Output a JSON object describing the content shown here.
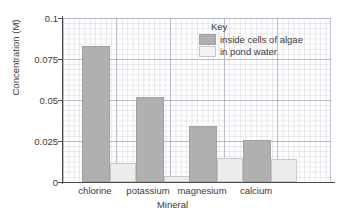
{
  "chart_data": {
    "type": "bar",
    "title": "",
    "xlabel": "Mineral",
    "ylabel": "Concentration (M)",
    "categories": [
      "chlorine",
      "potassium",
      "magnesium",
      "calcium"
    ],
    "series": [
      {
        "name": "inside cells of algae",
        "color": "#b0b0b0",
        "values": [
          0.083,
          0.052,
          0.034,
          0.0255
        ]
      },
      {
        "name": "in pond water",
        "color": "#ececec",
        "values": [
          0.0115,
          0.0035,
          0.0145,
          0.0138
        ]
      }
    ],
    "ylim": [
      0,
      0.1
    ],
    "yticks": [
      0,
      0.025,
      0.05,
      0.075,
      0.1
    ],
    "ytick_labels": [
      "0",
      "0.025",
      "0.05",
      "0.075",
      "0.1"
    ],
    "grid": true,
    "legend": {
      "title": "Key",
      "position": "top-right"
    }
  },
  "legend": {
    "title": "Key",
    "entries": [
      {
        "label": "inside cells of algae"
      },
      {
        "label": "in pond water"
      }
    ]
  },
  "axes": {
    "y_title": "Concentration (M)",
    "x_title": "Mineral",
    "y_labels": [
      "0.1",
      "0.075",
      "0.05",
      "0.025",
      "0"
    ],
    "x_labels": [
      "chlorine",
      "potassium",
      "magnesium",
      "calcium"
    ]
  }
}
